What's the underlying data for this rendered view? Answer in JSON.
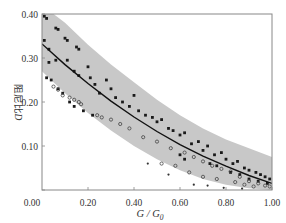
{
  "chart_data": {
    "type": "scatter",
    "title": "",
    "xlabel": "G / G0",
    "xlabel_display": {
      "main": "G / G",
      "sub": "0"
    },
    "ylabel": "阻尼比D",
    "ylabel_display": {
      "text": "阻尼比",
      "var": "D"
    },
    "xlim": [
      0.0,
      1.0
    ],
    "ylim": [
      0.0,
      0.4
    ],
    "xticks": [
      "0.20",
      "0.40",
      "0.60",
      "0.80",
      "1.00"
    ],
    "xtick_values": [
      0.2,
      0.4,
      0.6,
      0.8,
      1.0
    ],
    "yticks": [
      "0.00",
      "0.10",
      "0.20",
      "0.30",
      "0.40"
    ],
    "ytick_values": [
      0.0,
      0.1,
      0.2,
      0.3,
      0.4
    ],
    "grid": false,
    "legend": null,
    "note": "Scatter points are a representative approximation of the dense point cloud, not measured values. Axis ticks, labels, band envelope, and trend curve are read directly from the figure.",
    "band": {
      "name": "scatter envelope (shaded)",
      "color": "#c8c8c8",
      "upper": {
        "x": [
          0.0,
          0.1,
          0.2,
          0.3,
          0.4,
          0.5,
          0.6,
          0.7,
          0.8,
          0.9,
          1.0
        ],
        "y": [
          0.42,
          0.38,
          0.33,
          0.285,
          0.245,
          0.205,
          0.17,
          0.14,
          0.115,
          0.095,
          0.075
        ]
      },
      "lower": {
        "x": [
          0.0,
          0.1,
          0.2,
          0.3,
          0.4,
          0.5,
          0.6,
          0.7,
          0.8,
          0.9,
          1.0
        ],
        "y": [
          0.27,
          0.22,
          0.175,
          0.135,
          0.1,
          0.07,
          0.045,
          0.025,
          0.012,
          0.004,
          0.0
        ]
      }
    },
    "series": [
      {
        "name": "fitted curve",
        "type": "line",
        "color": "#111111",
        "x": [
          0.0,
          0.1,
          0.2,
          0.3,
          0.4,
          0.5,
          0.6,
          0.7,
          0.8,
          0.9,
          1.0
        ],
        "y": [
          0.332,
          0.285,
          0.242,
          0.202,
          0.166,
          0.133,
          0.103,
          0.077,
          0.054,
          0.033,
          0.015
        ]
      },
      {
        "name": "test data (filled markers)",
        "type": "scatter",
        "marker": "square",
        "color": "#1a1a1a",
        "points": [
          [
            0.01,
            0.395
          ],
          [
            0.02,
            0.39
          ],
          [
            0.06,
            0.368
          ],
          [
            0.07,
            0.365
          ],
          [
            0.1,
            0.345
          ],
          [
            0.11,
            0.34
          ],
          [
            0.15,
            0.325
          ],
          [
            0.16,
            0.32
          ],
          [
            0.01,
            0.34
          ],
          [
            0.03,
            0.32
          ],
          [
            0.06,
            0.295
          ],
          [
            0.11,
            0.295
          ],
          [
            0.03,
            0.29
          ],
          [
            0.02,
            0.255
          ],
          [
            0.04,
            0.25
          ],
          [
            0.14,
            0.27
          ],
          [
            0.16,
            0.26
          ],
          [
            0.2,
            0.28
          ],
          [
            0.21,
            0.255
          ],
          [
            0.23,
            0.24
          ],
          [
            0.25,
            0.22
          ],
          [
            0.28,
            0.25
          ],
          [
            0.3,
            0.23
          ],
          [
            0.32,
            0.21
          ],
          [
            0.35,
            0.2
          ],
          [
            0.38,
            0.19
          ],
          [
            0.4,
            0.215
          ],
          [
            0.42,
            0.18
          ],
          [
            0.45,
            0.17
          ],
          [
            0.48,
            0.165
          ],
          [
            0.5,
            0.155
          ],
          [
            0.52,
            0.16
          ],
          [
            0.55,
            0.14
          ],
          [
            0.57,
            0.135
          ],
          [
            0.6,
            0.125
          ],
          [
            0.62,
            0.13
          ],
          [
            0.65,
            0.105
          ],
          [
            0.68,
            0.11
          ],
          [
            0.7,
            0.09
          ],
          [
            0.72,
            0.1
          ],
          [
            0.75,
            0.08
          ],
          [
            0.78,
            0.085
          ],
          [
            0.8,
            0.07
          ],
          [
            0.83,
            0.06
          ],
          [
            0.85,
            0.065
          ],
          [
            0.88,
            0.05
          ],
          [
            0.9,
            0.045
          ],
          [
            0.93,
            0.04
          ],
          [
            0.95,
            0.035
          ],
          [
            0.97,
            0.03
          ],
          [
            0.99,
            0.025
          ],
          [
            0.07,
            0.23
          ],
          [
            0.09,
            0.22
          ],
          [
            0.12,
            0.2
          ],
          [
            0.14,
            0.19
          ],
          [
            0.18,
            0.18
          ],
          [
            0.22,
            0.17
          ],
          [
            0.6,
            0.08
          ],
          [
            0.62,
            0.07
          ],
          [
            0.73,
            0.06
          ],
          [
            0.76,
            0.055
          ],
          [
            0.82,
            0.04
          ],
          [
            0.86,
            0.035
          ],
          [
            0.9,
            0.025
          ],
          [
            0.94,
            0.02
          ],
          [
            0.98,
            0.015
          ]
        ]
      },
      {
        "name": "test data (open markers)",
        "type": "scatter",
        "marker": "circle-open",
        "color": "#444444",
        "points": [
          [
            0.05,
            0.235
          ],
          [
            0.07,
            0.228
          ],
          [
            0.09,
            0.215
          ],
          [
            0.12,
            0.21
          ],
          [
            0.14,
            0.205
          ],
          [
            0.16,
            0.2
          ],
          [
            0.17,
            0.195
          ],
          [
            0.24,
            0.17
          ],
          [
            0.26,
            0.165
          ],
          [
            0.3,
            0.16
          ],
          [
            0.34,
            0.15
          ],
          [
            0.38,
            0.14
          ],
          [
            0.44,
            0.12
          ],
          [
            0.5,
            0.11
          ],
          [
            0.56,
            0.095
          ],
          [
            0.62,
            0.085
          ],
          [
            0.66,
            0.075
          ],
          [
            0.7,
            0.065
          ],
          [
            0.74,
            0.055
          ],
          [
            0.78,
            0.048
          ],
          [
            0.82,
            0.042
          ],
          [
            0.86,
            0.03
          ],
          [
            0.9,
            0.02
          ],
          [
            0.94,
            0.015
          ],
          [
            0.97,
            0.01
          ],
          [
            0.99,
            0.008
          ],
          [
            0.52,
            0.06
          ],
          [
            0.58,
            0.055
          ],
          [
            0.64,
            0.04
          ],
          [
            0.7,
            0.03
          ],
          [
            0.76,
            0.025
          ],
          [
            0.84,
            0.018
          ],
          [
            0.88,
            0.012
          ],
          [
            0.92,
            0.008
          ]
        ]
      },
      {
        "name": "outliers below band",
        "type": "scatter",
        "marker": "dot",
        "color": "#333333",
        "points": [
          [
            0.46,
            0.06
          ],
          [
            0.55,
            0.035
          ],
          [
            0.66,
            0.012
          ],
          [
            0.72,
            0.01
          ],
          [
            0.79,
            0.005
          ],
          [
            0.87,
            0.003
          ]
        ]
      }
    ]
  },
  "colors": {
    "band": "#c8c8c8",
    "axis": "#888888",
    "curve": "#111111",
    "marker": "#1a1a1a",
    "text": "#333333"
  }
}
